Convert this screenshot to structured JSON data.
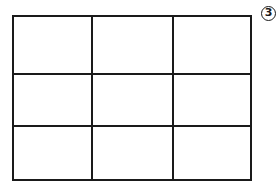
{
  "diagram": {
    "type": "grid",
    "rows": 3,
    "columns": 3,
    "label": "3"
  }
}
